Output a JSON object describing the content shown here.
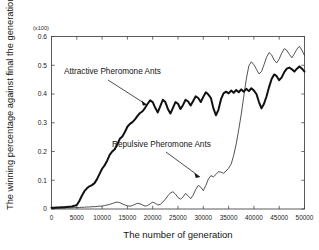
{
  "chart_data": {
    "type": "line",
    "title": "",
    "xlabel": "The number of generation",
    "ylabel": "The winning percentage against final the generation",
    "scale_note": "(x100)",
    "xlim": [
      0,
      50000
    ],
    "ylim": [
      0,
      0.6
    ],
    "grid": false,
    "legend_position": "inline-annotations",
    "xticks": [
      0,
      5000,
      10000,
      15000,
      20000,
      25000,
      30000,
      35000,
      40000,
      45000,
      50000
    ],
    "xtick_labels": [
      "0",
      "5000",
      "10000",
      "15000",
      "20000",
      "25000",
      "30000",
      "35000",
      "40000",
      "45000",
      "50000"
    ],
    "yticks": [
      0,
      0.1,
      0.2,
      0.3,
      0.4,
      0.5,
      0.6
    ],
    "ytick_labels": [
      "0",
      "0.1",
      "0.2",
      "0.3",
      "0.4",
      "0.5",
      "0.6"
    ],
    "x": [
      0,
      500,
      1000,
      1500,
      2000,
      2500,
      3000,
      3500,
      4000,
      4500,
      5000,
      5500,
      6000,
      6500,
      7000,
      7500,
      8000,
      8500,
      9000,
      9500,
      10000,
      10500,
      11000,
      11500,
      12000,
      12500,
      13000,
      13500,
      14000,
      14500,
      15000,
      15500,
      16000,
      16500,
      17000,
      17500,
      18000,
      18500,
      19000,
      19500,
      20000,
      20500,
      21000,
      21500,
      22000,
      22500,
      23000,
      23500,
      24000,
      24500,
      25000,
      25500,
      26000,
      26500,
      27000,
      27500,
      28000,
      28500,
      29000,
      29500,
      30000,
      30500,
      31000,
      31500,
      32000,
      32500,
      33000,
      33500,
      34000,
      34500,
      35000,
      35500,
      36000,
      36500,
      37000,
      37500,
      38000,
      38500,
      39000,
      39500,
      40000,
      40500,
      41000,
      41500,
      42000,
      42500,
      43000,
      43500,
      44000,
      44500,
      45000,
      45500,
      46000,
      46500,
      47000,
      47500,
      48000,
      48500,
      49000,
      49500,
      50000
    ],
    "series": [
      {
        "name": "Attractive Pheromone Ants",
        "style": "thick",
        "annotation_label": "Attractive Pheromone Ants",
        "values": [
          0.004,
          0.004,
          0.005,
          0.005,
          0.006,
          0.006,
          0.007,
          0.008,
          0.009,
          0.011,
          0.014,
          0.028,
          0.046,
          0.062,
          0.072,
          0.079,
          0.083,
          0.09,
          0.104,
          0.122,
          0.14,
          0.152,
          0.168,
          0.188,
          0.2,
          0.208,
          0.225,
          0.244,
          0.252,
          0.268,
          0.286,
          0.296,
          0.302,
          0.312,
          0.324,
          0.334,
          0.34,
          0.352,
          0.366,
          0.378,
          0.372,
          0.352,
          0.336,
          0.358,
          0.38,
          0.372,
          0.348,
          0.332,
          0.352,
          0.372,
          0.366,
          0.348,
          0.362,
          0.38,
          0.374,
          0.36,
          0.376,
          0.392,
          0.386,
          0.372,
          0.39,
          0.406,
          0.398,
          0.386,
          0.35,
          0.326,
          0.346,
          0.382,
          0.402,
          0.408,
          0.402,
          0.412,
          0.404,
          0.414,
          0.406,
          0.416,
          0.408,
          0.418,
          0.41,
          0.42,
          0.412,
          0.4,
          0.372,
          0.35,
          0.366,
          0.392,
          0.424,
          0.452,
          0.468,
          0.462,
          0.448,
          0.458,
          0.476,
          0.488,
          0.492,
          0.486,
          0.478,
          0.488,
          0.496,
          0.488,
          0.478
        ]
      },
      {
        "name": "Repulsive Pheromone Ants",
        "style": "thin",
        "annotation_label": "Repulsive Pheromone Ants",
        "values": [
          0.002,
          0.002,
          0.002,
          0.003,
          0.003,
          0.003,
          0.004,
          0.004,
          0.004,
          0.005,
          0.005,
          0.005,
          0.006,
          0.006,
          0.007,
          0.007,
          0.008,
          0.008,
          0.009,
          0.01,
          0.01,
          0.012,
          0.014,
          0.016,
          0.019,
          0.022,
          0.024,
          0.022,
          0.018,
          0.014,
          0.011,
          0.01,
          0.012,
          0.016,
          0.02,
          0.018,
          0.014,
          0.01,
          0.012,
          0.018,
          0.024,
          0.02,
          0.014,
          0.016,
          0.024,
          0.034,
          0.046,
          0.056,
          0.06,
          0.052,
          0.04,
          0.034,
          0.042,
          0.054,
          0.046,
          0.036,
          0.048,
          0.068,
          0.082,
          0.076,
          0.064,
          0.082,
          0.104,
          0.116,
          0.112,
          0.12,
          0.13,
          0.128,
          0.124,
          0.132,
          0.142,
          0.156,
          0.186,
          0.226,
          0.276,
          0.33,
          0.392,
          0.452,
          0.498,
          0.512,
          0.502,
          0.486,
          0.47,
          0.478,
          0.502,
          0.528,
          0.544,
          0.536,
          0.518,
          0.508,
          0.522,
          0.542,
          0.558,
          0.552,
          0.538,
          0.526,
          0.54,
          0.556,
          0.566,
          0.552,
          0.534
        ]
      }
    ],
    "annotations": [
      {
        "text": "Attractive Pheromone Ants",
        "target_series": "Attractive Pheromone Ants"
      },
      {
        "text": "Repulsive Pheromone Ants",
        "target_series": "Repulsive Pheromone Ants"
      }
    ]
  }
}
